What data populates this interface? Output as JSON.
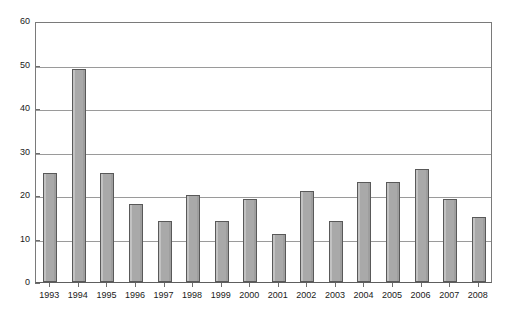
{
  "chart_data": {
    "type": "bar",
    "title": "",
    "subtitle": "",
    "xlabel": "",
    "ylabel": "",
    "categories": [
      "1993",
      "1994",
      "1995",
      "1996",
      "1997",
      "1998",
      "1999",
      "2000",
      "2001",
      "2002",
      "2003",
      "2004",
      "2005",
      "2006",
      "2007",
      "2008"
    ],
    "values": [
      25,
      49,
      25,
      18,
      14,
      20,
      14,
      19,
      11,
      21,
      14,
      23,
      23,
      26,
      19,
      15
    ],
    "series": [
      {
        "name": "",
        "values": [
          25,
          49,
          25,
          18,
          14,
          20,
          14,
          19,
          11,
          21,
          14,
          23,
          23,
          26,
          19,
          15
        ]
      }
    ],
    "ylim": [
      0,
      60
    ],
    "ytick_labels": [
      "0",
      "10",
      "20",
      "30",
      "40",
      "50",
      "60"
    ],
    "ytick_values": [
      0,
      10,
      20,
      30,
      40,
      50,
      60
    ],
    "grid": true,
    "grid_axis": "y",
    "legend": false,
    "legend_position": "none",
    "annotations": [],
    "colors": {
      "bar_fill": "#a9a9a9",
      "bar_border": "#595959",
      "gridline": "#9a9a9a",
      "axis": "#7a7a7a",
      "text": "#1a1a1a",
      "background": "#ffffff"
    }
  }
}
